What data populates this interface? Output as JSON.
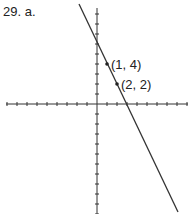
{
  "problem_label": "29. a.",
  "graph": {
    "equation": "y = -2x + 6",
    "x_axis": {
      "min": -9,
      "max": 9,
      "tick_step": 1
    },
    "y_axis": {
      "min": -11,
      "max": 10,
      "tick_step": 1
    },
    "line_color": "#333333",
    "points": [
      {
        "x": 1,
        "y": 4,
        "label": "(1, 4)"
      },
      {
        "x": 2,
        "y": 2,
        "label": "(2, 2)"
      }
    ]
  }
}
